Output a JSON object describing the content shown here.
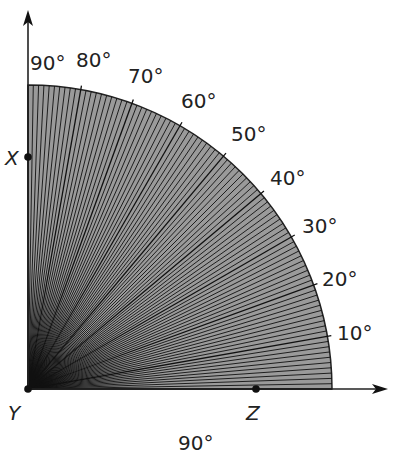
{
  "diagram": {
    "type": "protractor-quarter-circle",
    "origin": {
      "x": 28,
      "y": 389
    },
    "radius": 304,
    "fill_color": "#9a9a9a",
    "ray_color": "#111111",
    "ray_step_degrees": 1,
    "major_tick_step_degrees": 10,
    "angle_labels": [
      {
        "text": "90°",
        "angle": 90,
        "x": 30,
        "y": 70
      },
      {
        "text": "80°",
        "angle": 80,
        "x": 76,
        "y": 67
      },
      {
        "text": "70°",
        "angle": 70,
        "x": 128,
        "y": 83
      },
      {
        "text": "60°",
        "angle": 60,
        "x": 181,
        "y": 108
      },
      {
        "text": "50°",
        "angle": 50,
        "x": 231,
        "y": 141
      },
      {
        "text": "40°",
        "angle": 40,
        "x": 270,
        "y": 185
      },
      {
        "text": "30°",
        "angle": 30,
        "x": 302,
        "y": 233
      },
      {
        "text": "20°",
        "angle": 20,
        "x": 322,
        "y": 286
      },
      {
        "text": "10°",
        "angle": 10,
        "x": 337,
        "y": 340
      }
    ],
    "points": [
      {
        "label": "X",
        "x": 28,
        "y": 157,
        "label_x": 5,
        "label_y": 165
      },
      {
        "label": "Y",
        "x": 28,
        "y": 389,
        "label_x": 8,
        "label_y": 420
      },
      {
        "label": "Z",
        "x": 256,
        "y": 389,
        "label_x": 246,
        "label_y": 420
      }
    ],
    "bottom_label": {
      "text": "90°",
      "x": 178,
      "y": 450
    },
    "axes": {
      "vertical_arrow_tip": {
        "x": 28,
        "y": 10
      },
      "horizontal_arrow_tip": {
        "x": 388,
        "y": 389
      }
    }
  }
}
